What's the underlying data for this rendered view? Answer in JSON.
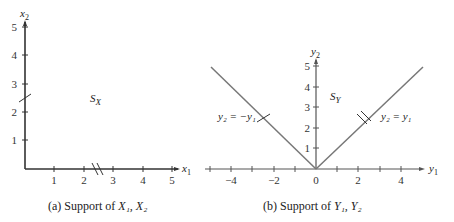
{
  "panel_a": {
    "caption_prefix": "(a) Support of ",
    "caption_vars": "X₁, X₂",
    "x_label": "x",
    "x_sub": "1",
    "y_label": "x",
    "y_sub": "2",
    "region_label": "S",
    "region_sub": "X",
    "x_ticks": [
      "1",
      "2",
      "3",
      "4",
      "5"
    ],
    "y_ticks": [
      "1",
      "2",
      "3",
      "4",
      "5"
    ]
  },
  "panel_b": {
    "caption_prefix": "(b) Support of ",
    "caption_vars": "Y₁, Y₂",
    "x_label": "y",
    "x_sub": "1",
    "y_label": "y",
    "y_sub": "2",
    "region_label": "S",
    "region_sub": "Y",
    "x_ticks": [
      "−4",
      "−2",
      "0",
      "2",
      "4"
    ],
    "y_ticks": [
      "1",
      "2",
      "3",
      "4",
      "5"
    ],
    "line_left_label": "y₂ = −y₁",
    "line_right_label": "y₂ = y₁"
  },
  "colors": {
    "axis": "#333333",
    "line": "#777777"
  }
}
